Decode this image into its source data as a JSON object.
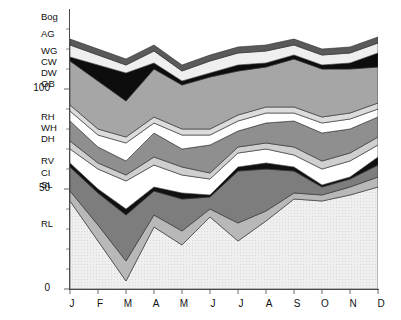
{
  "chart_data": {
    "type": "area",
    "title": "",
    "xlabel": "",
    "ylabel": "",
    "stacked": true,
    "grid": false,
    "legend_position": "left-axis-labels",
    "ylim": [
      0,
      140
    ],
    "yticks": [
      0,
      50,
      100
    ],
    "ytick_labels": [
      "0",
      "50",
      "100"
    ],
    "yminor_ticks": [
      10,
      20,
      30,
      40,
      60,
      70,
      80,
      90,
      110,
      120,
      130
    ],
    "categories": [
      "J",
      "F",
      "M",
      "A",
      "M",
      "J",
      "J",
      "A",
      "S",
      "O",
      "N",
      "D"
    ],
    "x": [
      "J",
      "F",
      "M",
      "A",
      "M",
      "J",
      "J",
      "A",
      "S",
      "O",
      "N",
      "D"
    ],
    "series": [
      {
        "name": "RL",
        "label": "RL",
        "color": "#e9e9e9",
        "values": [
          44,
          24,
          4,
          31,
          22,
          36,
          24,
          34,
          45,
          44,
          47,
          51
        ]
      },
      {
        "name": "SL",
        "label": "SL",
        "color": "#b8b8b8",
        "values": [
          5,
          8,
          10,
          6,
          7,
          4,
          9,
          5,
          3,
          3,
          4,
          5
        ]
      },
      {
        "name": "CI",
        "label": "CI",
        "color": "#7d7d7d",
        "values": [
          12,
          16,
          23,
          12,
          16,
          6,
          26,
          21,
          11,
          4,
          4,
          6
        ]
      },
      {
        "name": "RV",
        "label": "RV",
        "color": "#111111",
        "values": [
          2,
          2,
          3,
          2,
          3,
          1,
          2,
          3,
          2,
          1,
          1,
          4
        ]
      },
      {
        "name": "DH",
        "label": "DH",
        "color": "#ffffff",
        "values": [
          7,
          10,
          14,
          11,
          9,
          8,
          7,
          7,
          6,
          8,
          8,
          6
        ]
      },
      {
        "name": "WH",
        "label": "WH",
        "color": "#cfcfcf",
        "values": [
          4,
          3,
          3,
          4,
          4,
          3,
          3,
          3,
          4,
          4,
          4,
          4
        ]
      },
      {
        "name": "RH",
        "label": "RH",
        "color": "#8f8f8f",
        "values": [
          10,
          8,
          7,
          12,
          9,
          14,
          8,
          10,
          13,
          14,
          12,
          10
        ]
      },
      {
        "name": "GB",
        "label": "GB",
        "color": "#ffffff",
        "values": [
          5,
          6,
          9,
          5,
          7,
          5,
          5,
          5,
          4,
          5,
          5,
          4
        ]
      },
      {
        "name": "DW",
        "label": "DW",
        "color": "#dcdcdc",
        "values": [
          3,
          3,
          3,
          3,
          3,
          3,
          3,
          3,
          3,
          3,
          3,
          3
        ]
      },
      {
        "name": "CW",
        "label": "CW",
        "color": "#a6a6a6",
        "values": [
          22,
          24,
          18,
          24,
          22,
          26,
          22,
          20,
          24,
          24,
          22,
          18
        ]
      },
      {
        "name": "WG",
        "label": "WG",
        "color": "#0d0d0d",
        "values": [
          2,
          8,
          14,
          3,
          2,
          2,
          3,
          2,
          2,
          2,
          3,
          7
        ]
      },
      {
        "name": "AG",
        "label": "AG",
        "color": "#efefef",
        "values": [
          6,
          5,
          4,
          6,
          5,
          6,
          6,
          6,
          5,
          5,
          5,
          5
        ]
      },
      {
        "name": "Bog",
        "label": "Bog",
        "color": "#5a5a5a",
        "values": [
          3,
          3,
          3,
          3,
          3,
          3,
          3,
          3,
          3,
          3,
          3,
          3
        ]
      }
    ],
    "axis_labels_left": [
      {
        "label": "Bog",
        "y_px": 16
      },
      {
        "label": "AG",
        "y_px": 33
      },
      {
        "label": "WG",
        "y_px": 50
      },
      {
        "label": "CW",
        "y_px": 61
      },
      {
        "label": "DW",
        "y_px": 72
      },
      {
        "label": "GB",
        "y_px": 83
      },
      {
        "label": "RH",
        "y_px": 116
      },
      {
        "label": "WH",
        "y_px": 127
      },
      {
        "label": "DH",
        "y_px": 138
      },
      {
        "label": "RV",
        "y_px": 160
      },
      {
        "label": "CI",
        "y_px": 172
      },
      {
        "label": "SL",
        "y_px": 184
      },
      {
        "label": "RL",
        "y_px": 223
      }
    ]
  },
  "axis": {
    "y_labels": [
      {
        "text": "100",
        "y_px": 88
      },
      {
        "text": "50",
        "y_px": 188
      },
      {
        "text": "0",
        "y_px": 288
      }
    ]
  }
}
